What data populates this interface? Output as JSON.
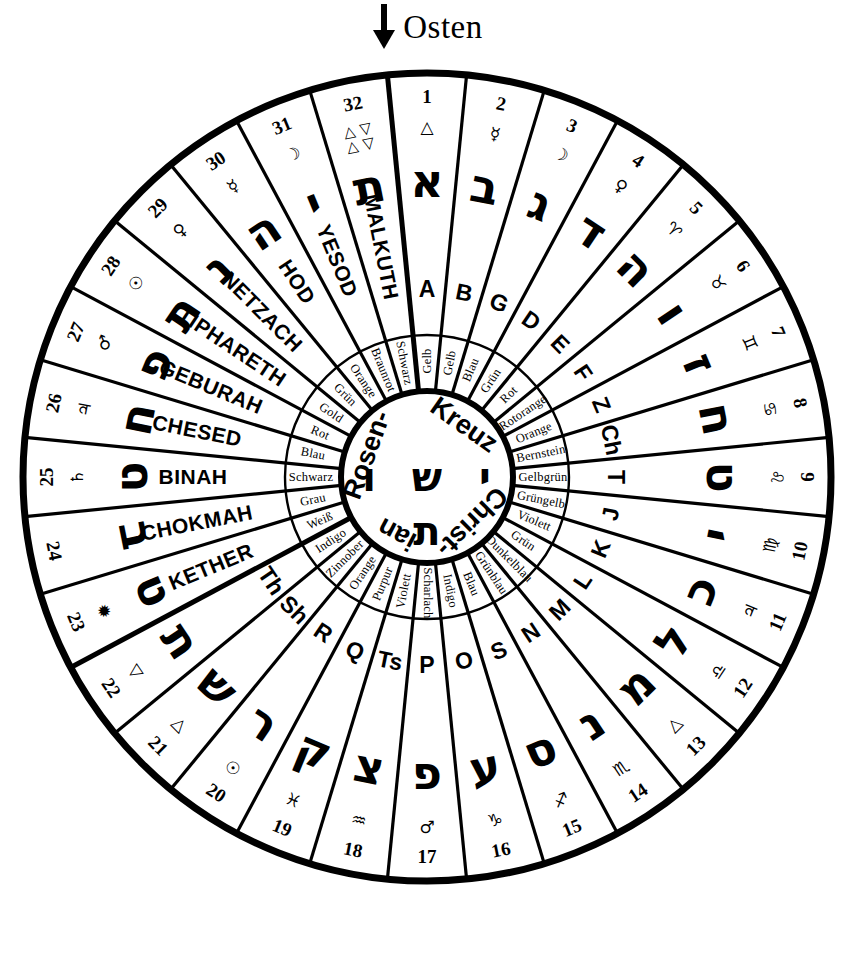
{
  "header": {
    "arrow_icon": "arrow-down-icon",
    "title": "Osten"
  },
  "center": {
    "words": [
      "Christ-",
      "ian",
      "Rosen-",
      "Kreuz"
    ],
    "hebrew_top": "ש",
    "hebrew_bottom": "ת",
    "hebrew_left": "ו",
    "hebrew_right": "י"
  },
  "rings": {
    "number_ring_label": "path-number",
    "astro_ring_label": "astrological-symbol",
    "hebrew_ring_label": "hebrew-letter",
    "name_ring_label": "sephira-or-latin-letter",
    "color_ring_label": "color-name"
  },
  "sectors": [
    {
      "num": "1",
      "astro": "△",
      "astro_name": "triangle-up",
      "heb": "א",
      "name": "A",
      "color": "Gelb"
    },
    {
      "num": "2",
      "astro": "☿",
      "astro_name": "mercury",
      "heb": "ב",
      "name": "B",
      "color": "Gelb"
    },
    {
      "num": "3",
      "astro": "☽",
      "astro_name": "moon",
      "heb": "ג",
      "name": "G",
      "color": "Blau"
    },
    {
      "num": "4",
      "astro": "♀",
      "astro_name": "venus",
      "heb": "ד",
      "name": "D",
      "color": "Grün"
    },
    {
      "num": "5",
      "astro": "♈",
      "astro_name": "aries",
      "heb": "ה",
      "name": "E",
      "color": "Rot"
    },
    {
      "num": "6",
      "astro": "♉",
      "astro_name": "taurus",
      "heb": "ו",
      "name": "F",
      "color": "Rotorange"
    },
    {
      "num": "7",
      "astro": "♊",
      "astro_name": "gemini",
      "heb": "ז",
      "name": "Z",
      "color": "Orange"
    },
    {
      "num": "8",
      "astro": "♋",
      "astro_name": "cancer",
      "heb": "ח",
      "name": "Ch",
      "color": "Bernstein"
    },
    {
      "num": "9",
      "astro": "♌",
      "astro_name": "leo",
      "heb": "ט",
      "name": "T",
      "color": "Gelbgrün"
    },
    {
      "num": "10",
      "astro": "♍",
      "astro_name": "virgo",
      "heb": "י",
      "name": "J",
      "color": "Grüngelb"
    },
    {
      "num": "11",
      "astro": "♃",
      "astro_name": "jupiter",
      "heb": "כ",
      "name": "K",
      "color": "Violett"
    },
    {
      "num": "12",
      "astro": "♎",
      "astro_name": "libra",
      "heb": "ל",
      "name": "L",
      "color": "Grün"
    },
    {
      "num": "13",
      "astro": "△",
      "astro_name": "triangle-up",
      "heb": "מ",
      "name": "M",
      "color": "Dunkelblau"
    },
    {
      "num": "14",
      "astro": "♏",
      "astro_name": "scorpio",
      "heb": "נ",
      "name": "N",
      "color": "Grünblau"
    },
    {
      "num": "15",
      "astro": "♐",
      "astro_name": "sagittarius",
      "heb": "ס",
      "name": "S",
      "color": "Blau"
    },
    {
      "num": "16",
      "astro": "♑",
      "astro_name": "capricorn",
      "heb": "ע",
      "name": "O",
      "color": "Indigo"
    },
    {
      "num": "17",
      "astro": "♂",
      "astro_name": "mars",
      "heb": "פ",
      "name": "P",
      "color": "Scharlach"
    },
    {
      "num": "18",
      "astro": "♒",
      "astro_name": "aquarius",
      "heb": "צ",
      "name": "Ts",
      "color": "Violett"
    },
    {
      "num": "19",
      "astro": "♓",
      "astro_name": "pisces",
      "heb": "ק",
      "name": "Q",
      "color": "Purpur"
    },
    {
      "num": "20",
      "astro": "☉",
      "astro_name": "sun",
      "heb": "ר",
      "name": "R",
      "color": "Orange"
    },
    {
      "num": "21",
      "astro": "△",
      "astro_name": "triangle-up",
      "heb": "ש",
      "name": "Sh",
      "color": "Zinnober"
    },
    {
      "num": "22",
      "astro": "▽",
      "astro_name": "triangle-down",
      "heb": "ת",
      "name": "Th",
      "color": "Indigo"
    },
    {
      "num": "23",
      "astro": "✹",
      "astro_name": "wheel",
      "heb": "ט",
      "name": "KETHER",
      "color": "Weiß"
    },
    {
      "num": "24",
      "astro": "",
      "astro_name": "",
      "heb": "ב",
      "name": "CHOKMAH",
      "color": "Grau"
    },
    {
      "num": "25",
      "astro": "♄",
      "astro_name": "saturn",
      "heb": "ט",
      "name": "BINAH",
      "color": "Schwarz"
    },
    {
      "num": "26",
      "astro": "♃",
      "astro_name": "jupiter",
      "heb": "ח",
      "name": "CHESED",
      "color": "Blau"
    },
    {
      "num": "27",
      "astro": "♂",
      "astro_name": "mars",
      "heb": "פ",
      "name": "GEBURAH",
      "color": "Rot"
    },
    {
      "num": "28",
      "astro": "☉",
      "astro_name": "sun",
      "heb": "ת",
      "name": "TIPHARETH",
      "color": "Gold"
    },
    {
      "num": "29",
      "astro": "♀",
      "astro_name": "venus",
      "heb": "נ",
      "name": "NETZACH",
      "color": "Grün"
    },
    {
      "num": "30",
      "astro": "☿",
      "astro_name": "mercury",
      "heb": "ה",
      "name": "HOD",
      "color": "Orange"
    },
    {
      "num": "31",
      "astro": "☽",
      "astro_name": "moon",
      "heb": "י",
      "name": "YESOD",
      "color": "Braunrot"
    },
    {
      "num": "32",
      "astro": "△▽△▽",
      "astro_name": "four-elements",
      "heb": "ת",
      "name": "MALKUTH",
      "color": "Schwarz"
    }
  ]
}
